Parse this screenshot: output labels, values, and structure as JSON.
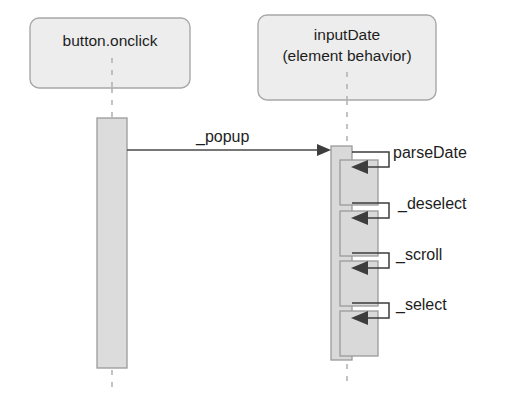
{
  "diagram": {
    "type": "uml-sequence-diagram",
    "background_color": "#ffffff",
    "lifelines": [
      {
        "id": "button-onclick",
        "name_lines": [
          "button.onclick"
        ],
        "box": {
          "x": 30,
          "y": 18,
          "width": 160,
          "height": 70
        },
        "center_x": 112,
        "header_fill": "#ededed",
        "header_stroke": "#a8a8a8",
        "activation": {
          "x": 97,
          "y": 118,
          "width": 30,
          "height": 250
        },
        "lifeline_dash_top": {
          "x": 112,
          "y1": 88,
          "y2": 118
        },
        "lifeline_dash_bottom": {
          "x": 112,
          "y1": 368,
          "y2": 390
        }
      },
      {
        "id": "input-date",
        "name_lines": [
          "inputDate",
          "(element behavior)"
        ],
        "box": {
          "x": 258,
          "y": 15,
          "width": 178,
          "height": 85
        },
        "center_x": 347,
        "header_fill": "#ededed",
        "header_stroke": "#a8a8a8",
        "activation": {
          "x": 331,
          "y": 146,
          "width": 21,
          "height": 214
        },
        "lifeline_dash_top": {
          "x": 347,
          "y1": 100,
          "y2": 146
        },
        "lifeline_dash_bottom": {
          "x": 347,
          "y1": 360,
          "y2": 382
        }
      }
    ],
    "messages": [
      {
        "id": "popup",
        "label": "_popup",
        "kind": "call",
        "from": "button-onclick",
        "to": "input-date",
        "line": {
          "x1": 127,
          "y1": 150,
          "x2": 331,
          "y2": 150
        },
        "label_pos": {
          "x": 196,
          "y": 142
        },
        "arrow_filled": true
      }
    ],
    "self_messages": [
      {
        "id": "parse-date",
        "label": "parseDate",
        "from": "input-date",
        "to": "input-date",
        "out_y": 152,
        "back_y": 167,
        "right_x": 389,
        "label_pos": {
          "x": 393,
          "y": 158
        },
        "nested_activation": {
          "x": 340,
          "y": 160,
          "width": 38,
          "height": 45
        }
      },
      {
        "id": "deselect",
        "label": "_deselect",
        "from": "input-date",
        "to": "input-date",
        "out_y": 203,
        "back_y": 218,
        "right_x": 389,
        "label_pos": {
          "x": 398,
          "y": 209
        },
        "nested_activation": {
          "x": 340,
          "y": 211,
          "width": 38,
          "height": 45
        }
      },
      {
        "id": "scroll",
        "label": "_scroll",
        "from": "input-date",
        "to": "input-date",
        "out_y": 253,
        "back_y": 268,
        "right_x": 389,
        "label_pos": {
          "x": 396,
          "y": 260
        },
        "nested_activation": {
          "x": 340,
          "y": 261,
          "width": 38,
          "height": 45
        }
      },
      {
        "id": "select",
        "label": "_select",
        "from": "input-date",
        "to": "input-date",
        "out_y": 303,
        "back_y": 318,
        "right_x": 389,
        "label_pos": {
          "x": 396,
          "y": 310
        },
        "nested_activation": {
          "x": 340,
          "y": 311,
          "width": 38,
          "height": 45
        }
      }
    ],
    "colors": {
      "header_fill": "#ededed",
      "header_stroke": "#a8a8a8",
      "activation_fill": "#d9d9d9",
      "activation_stroke": "#9a9a9a",
      "line": "#3d3d3d",
      "lifeline_dash": "#b4b4b4",
      "text": "#1d1d1d"
    }
  }
}
